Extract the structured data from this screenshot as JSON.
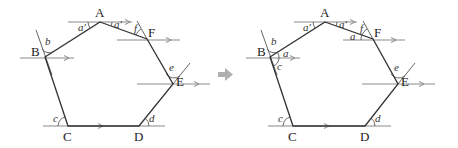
{
  "diagram": {
    "transition_arrow": {
      "icon": "right-arrow-icon",
      "color": "#b0b0b0"
    },
    "left": {
      "vertices": [
        {
          "label": "A"
        },
        {
          "label": "F"
        },
        {
          "label": "E"
        },
        {
          "label": "D"
        },
        {
          "label": "C"
        },
        {
          "label": "B"
        }
      ],
      "angles": [
        {
          "label": "a′"
        },
        {
          "label": "a′"
        },
        {
          "label": "f"
        },
        {
          "label": "b"
        },
        {
          "label": "e"
        },
        {
          "label": "c"
        },
        {
          "label": "d"
        }
      ]
    },
    "right": {
      "vertices": [
        {
          "label": "A"
        },
        {
          "label": "F"
        },
        {
          "label": "E"
        },
        {
          "label": "D"
        },
        {
          "label": "C"
        },
        {
          "label": "B"
        }
      ],
      "angles": [
        {
          "label": "a′"
        },
        {
          "label": "a′"
        },
        {
          "label": "f"
        },
        {
          "label": "a"
        },
        {
          "label": "b"
        },
        {
          "label": "a"
        },
        {
          "label": "c"
        },
        {
          "label": "e"
        },
        {
          "label": "c"
        },
        {
          "label": "d"
        }
      ]
    },
    "colors": {
      "edge": "#333333",
      "parallel_line": "#8a8a8a",
      "arrow": "#b0b0b0"
    }
  }
}
